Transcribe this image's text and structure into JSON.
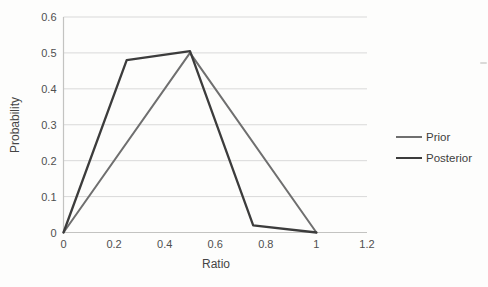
{
  "style": {
    "background": "#fdfdfc",
    "grid_color": "#d9d9d9",
    "axis_color": "#c3c3c1",
    "tick_text_color": "#4f4f4f",
    "axis_title_color": "#454545"
  },
  "chart_data": {
    "type": "line",
    "title": "",
    "xlabel": "Ratio",
    "ylabel": "Probability",
    "xlim": [
      0,
      1.2
    ],
    "ylim": [
      0,
      0.6
    ],
    "x_ticks": [
      0,
      0.2,
      0.4,
      0.6,
      0.8,
      1,
      1.2
    ],
    "x_tick_labels": [
      "0",
      "0.2",
      "0.4",
      "0.6",
      "0.8",
      "1",
      "1.2"
    ],
    "y_ticks": [
      0,
      0.1,
      0.2,
      0.3,
      0.4,
      0.5,
      0.6
    ],
    "y_tick_labels": [
      "0",
      "0.1",
      "0.2",
      "0.3",
      "0.4",
      "0.5",
      "0.6"
    ],
    "grid": "horizontal",
    "legend_position": "right",
    "series": [
      {
        "name": "Prior",
        "color": "#6f6f6f",
        "points": [
          [
            0,
            0
          ],
          [
            0.5,
            0.5
          ],
          [
            1,
            0
          ]
        ]
      },
      {
        "name": "Posterior",
        "color": "#3c3c3c",
        "points": [
          [
            0,
            0
          ],
          [
            0.25,
            0.48
          ],
          [
            0.5,
            0.505
          ],
          [
            0.75,
            0.02
          ],
          [
            1,
            0
          ]
        ]
      }
    ]
  },
  "artifact": {
    "note": "faint scan speck near right edge"
  }
}
